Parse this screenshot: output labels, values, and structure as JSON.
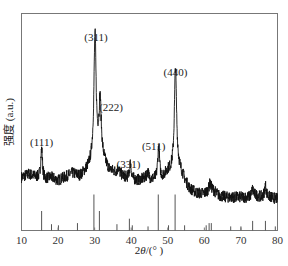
{
  "chart_data": {
    "type": "line",
    "title": "",
    "xlabel": "2θ/(°)",
    "ylabel": "强度 (a.u.)",
    "xlim": [
      10,
      80
    ],
    "grid": false,
    "legend": null,
    "x_ticks": [
      10,
      20,
      30,
      40,
      50,
      60,
      70,
      80
    ],
    "x_tick_labels": [
      "10",
      "20",
      "30",
      "40",
      "50",
      "60",
      "70",
      "80"
    ],
    "baseline": [
      [
        10,
        0.22
      ],
      [
        12,
        0.24
      ],
      [
        14,
        0.22
      ],
      [
        16,
        0.2
      ],
      [
        18,
        0.22
      ],
      [
        20,
        0.2
      ],
      [
        22,
        0.22
      ],
      [
        24,
        0.24
      ],
      [
        26,
        0.22
      ],
      [
        28,
        0.25
      ],
      [
        32,
        0.3
      ],
      [
        34,
        0.25
      ],
      [
        36,
        0.24
      ],
      [
        38,
        0.22
      ],
      [
        40,
        0.2
      ],
      [
        42,
        0.2
      ],
      [
        44,
        0.21
      ],
      [
        46,
        0.2
      ],
      [
        48,
        0.2
      ],
      [
        50,
        0.24
      ],
      [
        54,
        0.2
      ],
      [
        56,
        0.14
      ],
      [
        58,
        0.12
      ],
      [
        60,
        0.12
      ],
      [
        62,
        0.15
      ],
      [
        64,
        0.11
      ],
      [
        66,
        0.1
      ],
      [
        68,
        0.1
      ],
      [
        70,
        0.1
      ],
      [
        72,
        0.1
      ],
      [
        74,
        0.11
      ],
      [
        76,
        0.1
      ],
      [
        78,
        0.1
      ],
      [
        80,
        0.09
      ]
    ],
    "peaks": [
      {
        "label": "(111)",
        "two_theta": 15.5,
        "intensity": 0.39
      },
      {
        "label": "(311)",
        "two_theta": 30.1,
        "intensity": 1.0
      },
      {
        "label": "(222)",
        "two_theta": 31.5,
        "intensity": 0.62
      },
      {
        "label": "(331)",
        "two_theta": 39.8,
        "intensity": 0.3
      },
      {
        "label": "(511)",
        "two_theta": 47.5,
        "intensity": 0.4
      },
      {
        "label": "(440)",
        "two_theta": 52.1,
        "intensity": 0.82
      }
    ],
    "minor_peaks": [
      {
        "two_theta": 36.5,
        "intensity": 0.27
      },
      {
        "two_theta": 44.5,
        "intensity": 0.25
      },
      {
        "two_theta": 61.5,
        "intensity": 0.18
      },
      {
        "two_theta": 73.2,
        "intensity": 0.15
      },
      {
        "two_theta": 76.7,
        "intensity": 0.17
      }
    ],
    "reference_lines": [
      {
        "two_theta": 15.5,
        "height": 0.15
      },
      {
        "two_theta": 18.2,
        "height": 0.03
      },
      {
        "two_theta": 20.1,
        "height": 0.02
      },
      {
        "two_theta": 25.3,
        "height": 0.04
      },
      {
        "two_theta": 29.8,
        "height": 0.3
      },
      {
        "two_theta": 31.3,
        "height": 0.15
      },
      {
        "two_theta": 36.1,
        "height": 0.03
      },
      {
        "two_theta": 39.5,
        "height": 0.08
      },
      {
        "two_theta": 40.3,
        "height": 0.02
      },
      {
        "two_theta": 44.6,
        "height": 0.01
      },
      {
        "two_theta": 47.4,
        "height": 0.3
      },
      {
        "two_theta": 50.2,
        "height": 0.02
      },
      {
        "two_theta": 52.0,
        "height": 0.3
      },
      {
        "two_theta": 54.6,
        "height": 0.02
      },
      {
        "two_theta": 60.5,
        "height": 0.02
      },
      {
        "two_theta": 61.3,
        "height": 0.04
      },
      {
        "two_theta": 61.9,
        "height": 0.04
      },
      {
        "two_theta": 67.2,
        "height": 0.01
      },
      {
        "two_theta": 70.0,
        "height": 0.01
      },
      {
        "two_theta": 73.2,
        "height": 0.06
      },
      {
        "two_theta": 76.7,
        "height": 0.06
      },
      {
        "two_theta": 79.4,
        "height": 0.01
      }
    ]
  },
  "labels": {
    "xlabel_prefix": "2",
    "xlabel_theta": "θ",
    "xlabel_suffix": "/(° )",
    "ylabel": "强度 (a.u.)"
  }
}
